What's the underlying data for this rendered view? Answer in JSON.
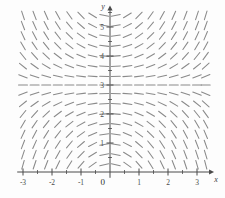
{
  "figure": {
    "kind": "slope-field",
    "background_color": "#fdfdfd",
    "axis_color": "#4a4a4a",
    "tick_color": "#4a4a4a",
    "segment_color": "#8a8a8a"
  },
  "axes": {
    "x_axis": {
      "label": "x",
      "tick_labels": [
        "-3",
        "-2",
        "-1",
        "1",
        "2",
        "3"
      ],
      "tick_values": [
        -3,
        -2,
        -1,
        1,
        2,
        3
      ],
      "minor_ticks": [
        -2.5,
        -1.5,
        -0.5,
        0.5,
        1.5,
        2.5
      ],
      "range": [
        -3.2,
        3.45
      ],
      "arrow": true
    },
    "y_axis": {
      "label": "y",
      "tick_labels": [
        "1",
        "2",
        "3",
        "4",
        "5"
      ],
      "tick_values": [
        1,
        2,
        3,
        4,
        5
      ],
      "minor_ticks": [
        0.5,
        1.5,
        2.5,
        3.5,
        4.5,
        5.5
      ],
      "range": [
        -0.2,
        5.6
      ],
      "arrow": true
    },
    "origin_label": "0"
  },
  "chart_data": {
    "type": "scatter",
    "title": "",
    "xlabel": "x",
    "ylabel": "y",
    "xlim": [
      -3.2,
      3.45
    ],
    "ylim": [
      -0.2,
      5.6
    ],
    "grid": false,
    "legend": "none",
    "field": {
      "equation": "dy/dx = x*(y-3)",
      "equilibrium_lines": [
        3
      ],
      "segment_length_px": 9,
      "x_samples": [
        -3.0,
        -2.6,
        -2.2,
        -1.8,
        -1.4,
        -1.0,
        -0.6,
        -0.2,
        0.2,
        0.6,
        1.0,
        1.4,
        1.8,
        2.2,
        2.6,
        3.0,
        3.3
      ],
      "y_samples": [
        0.25,
        0.6,
        0.95,
        1.3,
        1.65,
        2.0,
        2.35,
        2.7,
        3.0,
        3.3,
        3.65,
        4.0,
        4.35,
        4.7,
        5.05,
        5.4
      ],
      "slope_scale": 0.42,
      "description": "Short dashes whose tilt equals the slope; horizontal along y=3; positive slopes in upper-left and lower-right, negative slopes in upper-right and lower-left; steeper away from the y-axis."
    }
  }
}
